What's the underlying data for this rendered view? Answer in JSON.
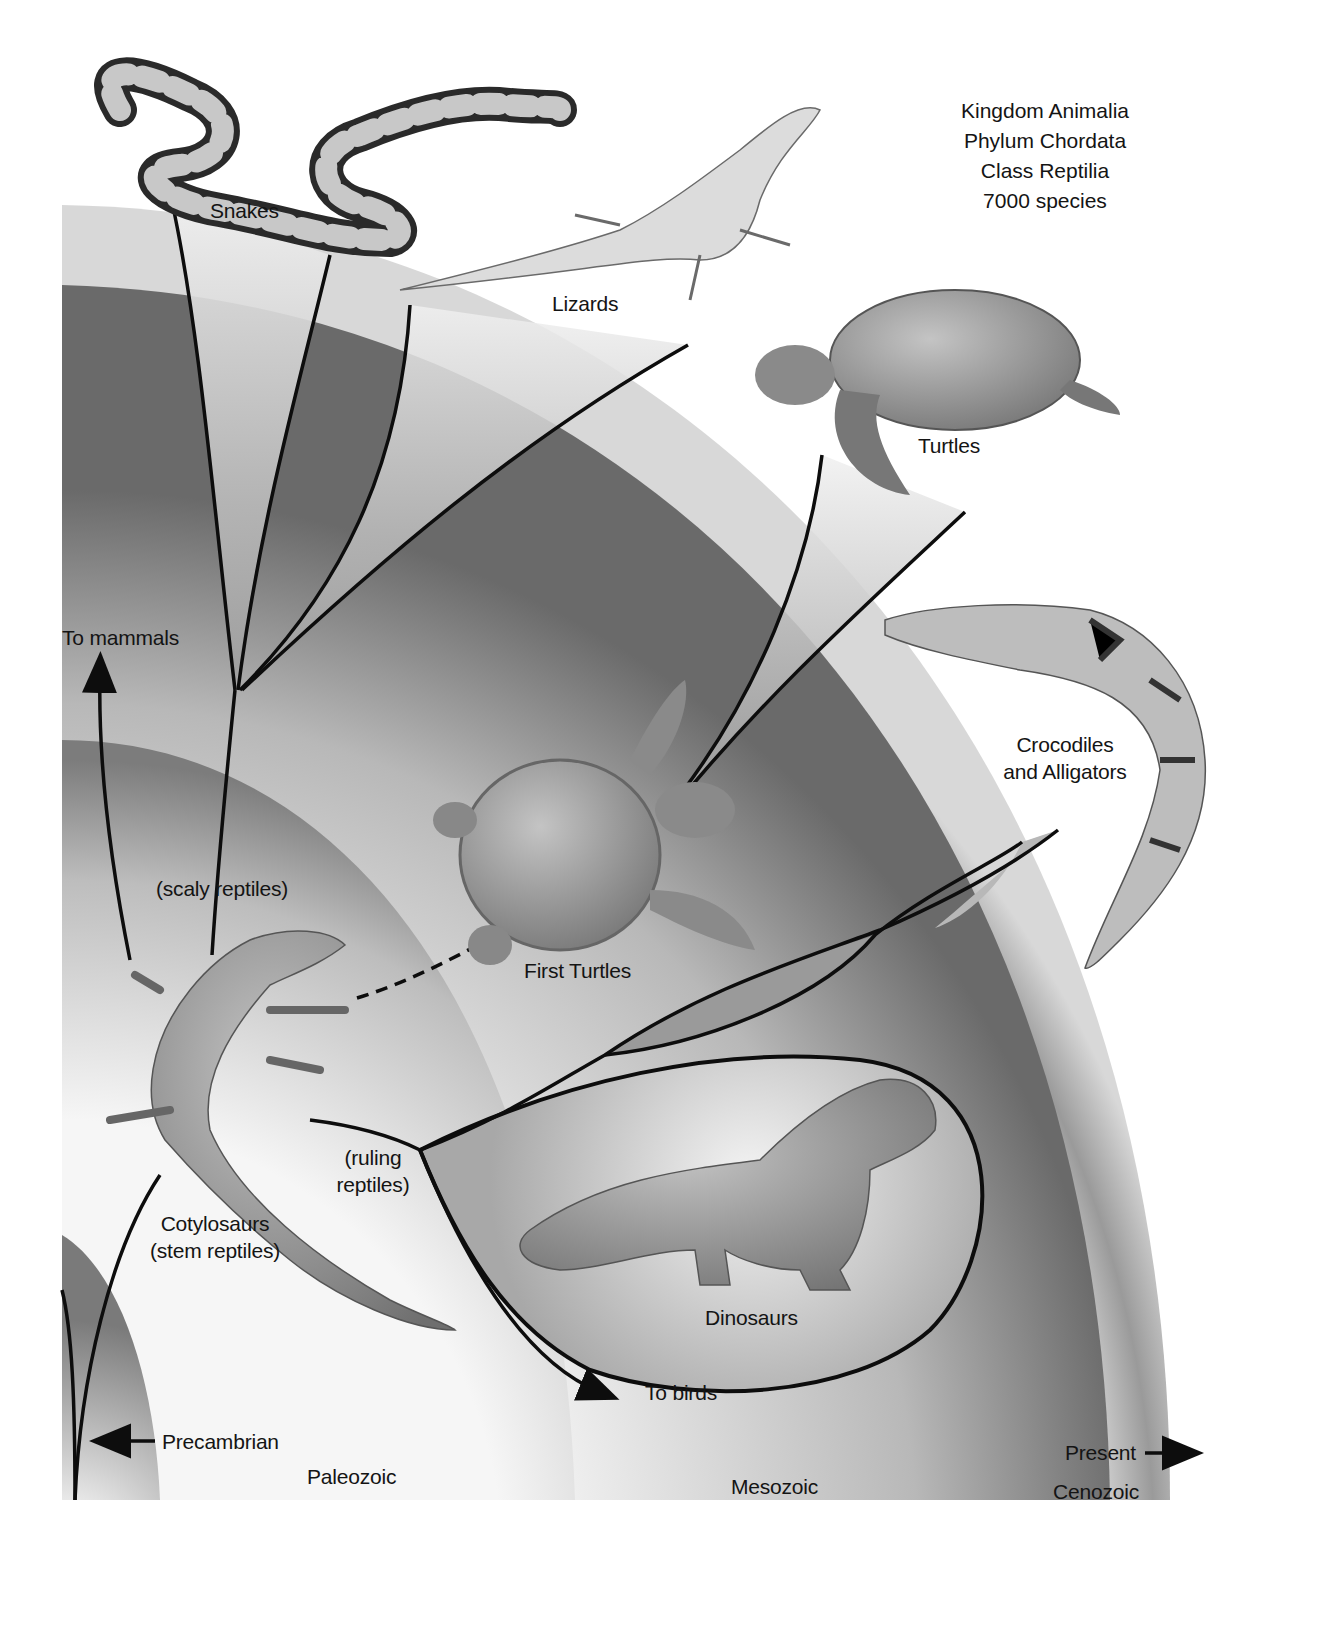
{
  "taxonomy": {
    "kingdom": "Kingdom Animalia",
    "phylum": "Phylum Chordata",
    "class": "Class Reptilia",
    "species_count": "7000 species"
  },
  "groups": {
    "snakes": "Snakes",
    "lizards": "Lizards",
    "turtles": "Turtles",
    "crocodiles_line1": "Crocodiles",
    "crocodiles_line2": "and Alligators",
    "first_turtles": "First Turtles",
    "scaly_reptiles": "(scaly reptiles)",
    "ruling_line1": "(ruling",
    "ruling_line2": "reptiles)",
    "cotylosaurs_line1": "Cotylosaurs",
    "cotylosaurs_line2": "(stem reptiles)",
    "dinosaurs": "Dinosaurs"
  },
  "arrows": {
    "to_mammals": "To mammals",
    "to_birds": "To birds"
  },
  "eras": {
    "precambrian": "Precambrian",
    "paleozoic": "Paleozoic",
    "mesozoic": "Mesozoic",
    "cenozoic": "Cenozoic",
    "present": "Present"
  },
  "colors": {
    "band_dark": "#6e6e6e",
    "band_light": "#f4f4f4",
    "line": "#0d0d0d",
    "clade_fill": "#9a9a9a",
    "animal_skin": "#8f8f8f"
  }
}
